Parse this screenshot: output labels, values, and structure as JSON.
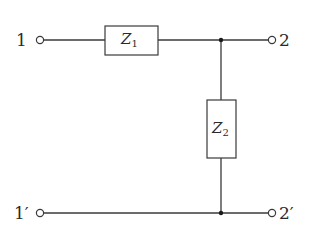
{
  "diagram": {
    "type": "two-port L-network (series Z1, shunt Z2)",
    "terminals": {
      "input_top": "1",
      "input_bottom": "1′",
      "output_top": "2",
      "output_bottom": "2′"
    },
    "components": [
      {
        "id": "Z1",
        "symbol": "Z",
        "subscript": "1",
        "placement": "series, top rail"
      },
      {
        "id": "Z2",
        "symbol": "Z",
        "subscript": "2",
        "placement": "shunt, between top and bottom rails"
      }
    ],
    "colors": {
      "line": "#3a3a3a",
      "junction": "#1a1a1a",
      "background": "#ffffff"
    }
  }
}
